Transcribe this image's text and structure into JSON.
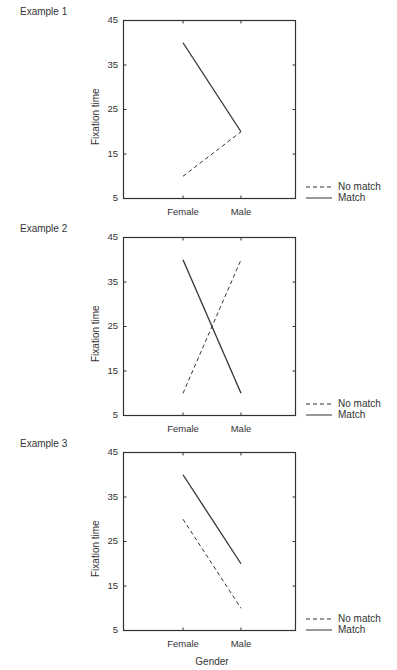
{
  "chart_data": [
    {
      "type": "line",
      "title": "Example 1",
      "categories": [
        "Female",
        "Male"
      ],
      "series": [
        {
          "name": "No match",
          "style": "dashed",
          "values": [
            10,
            20
          ]
        },
        {
          "name": "Match",
          "style": "solid",
          "values": [
            40,
            20
          ]
        }
      ],
      "xlabel": "",
      "ylabel": "Fixation time",
      "yticks": [
        "45",
        "35",
        "25",
        "15",
        "5"
      ],
      "ylim": [
        5,
        45
      ],
      "grid": false,
      "legend_position": "right-bottom"
    },
    {
      "type": "line",
      "title": "Example 2",
      "categories": [
        "Female",
        "Male"
      ],
      "series": [
        {
          "name": "No match",
          "style": "dashed",
          "values": [
            10,
            40
          ]
        },
        {
          "name": "Match",
          "style": "solid",
          "values": [
            40,
            10
          ]
        }
      ],
      "xlabel": "",
      "ylabel": "Fixation time",
      "yticks": [
        "45",
        "35",
        "25",
        "15",
        "5"
      ],
      "ylim": [
        5,
        45
      ],
      "grid": false,
      "legend_position": "right-bottom"
    },
    {
      "type": "line",
      "title": "Example 3",
      "categories": [
        "Female",
        "Male"
      ],
      "series": [
        {
          "name": "No match",
          "style": "dashed",
          "values": [
            30,
            10
          ]
        },
        {
          "name": "Match",
          "style": "solid",
          "values": [
            40,
            20
          ]
        }
      ],
      "xlabel": "Gender",
      "ylabel": "Fixation time",
      "yticks": [
        "45",
        "35",
        "25",
        "15",
        "5"
      ],
      "ylim": [
        5,
        45
      ],
      "grid": false,
      "legend_position": "right-bottom"
    }
  ],
  "panels": [
    {
      "label": "Example 1",
      "ylabel": "Fixation time",
      "xlabel": "",
      "xticks": [
        "Female",
        "Male"
      ],
      "yticks": [
        "45",
        "35",
        "25",
        "15",
        "5"
      ],
      "legend": {
        "no_match": "No match",
        "match": "Match"
      }
    },
    {
      "label": "Example 2",
      "ylabel": "Fixation time",
      "xlabel": "",
      "xticks": [
        "Female",
        "Male"
      ],
      "yticks": [
        "45",
        "35",
        "25",
        "15",
        "5"
      ],
      "legend": {
        "no_match": "No match",
        "match": "Match"
      }
    },
    {
      "label": "Example 3",
      "ylabel": "Fixation time",
      "xlabel": "Gender",
      "xticks": [
        "Female",
        "Male"
      ],
      "yticks": [
        "45",
        "35",
        "25",
        "15",
        "5"
      ],
      "legend": {
        "no_match": "No match",
        "match": "Match"
      }
    }
  ],
  "colors": {
    "line": "#333333",
    "axis": "#333333"
  }
}
